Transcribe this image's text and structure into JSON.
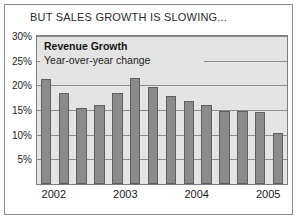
{
  "headline": "BUT SALES GROWTH IS SLOWING...",
  "legend": {
    "title": "Revenue Growth",
    "subtitle": "Year-over-year change"
  },
  "chart_data": {
    "type": "bar",
    "title": "BUT SALES GROWTH IS SLOWING...",
    "subtitle": "Revenue Growth — Year-over-year change",
    "xlabel": "",
    "ylabel": "",
    "ylim": [
      0,
      30
    ],
    "grid": true,
    "legend_position": "inside-top-left",
    "ytick_values": [
      5,
      10,
      15,
      20,
      25,
      30
    ],
    "ytick_labels": [
      "5%",
      "10%",
      "15%",
      "20%",
      "25%",
      "30%"
    ],
    "xtick_labels": [
      "2002",
      "2003",
      "2004",
      "2005"
    ],
    "xtick_positions": [
      0.5,
      4.5,
      8.5,
      12.5
    ],
    "bar_color": "#8b8b8b",
    "categories": [
      "2002 Q1",
      "2002 Q2",
      "2002 Q3",
      "2002 Q4",
      "2003 Q1",
      "2003 Q2",
      "2003 Q3",
      "2003 Q4",
      "2004 Q1",
      "2004 Q2",
      "2004 Q3",
      "2004 Q4",
      "2005 Q1",
      "2005 Q2"
    ],
    "values": [
      21.2,
      18.4,
      15.4,
      16.0,
      18.4,
      21.4,
      19.6,
      17.8,
      16.8,
      16.0,
      14.8,
      14.8,
      14.6,
      10.4
    ]
  }
}
